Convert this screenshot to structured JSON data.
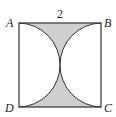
{
  "figure": {
    "side_label": "2",
    "vertices": {
      "A": "A",
      "B": "B",
      "C": "C",
      "D": "D"
    },
    "colors": {
      "stroke": "#333333",
      "shade": "#cfcfcf",
      "background": "#ffffff"
    }
  }
}
